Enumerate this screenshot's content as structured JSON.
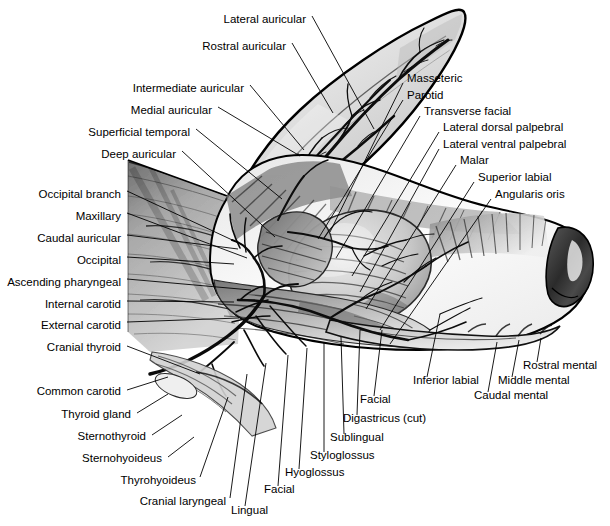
{
  "figure": {
    "background_color": "#ffffff",
    "line_color": "#000000",
    "style": "black-and-white airbrush / stipple medical illustration",
    "width": 610,
    "height": 526
  },
  "labels": [
    {
      "id": "lateral-auricular",
      "text": "Lateral auricular",
      "align": "right",
      "tx": 306,
      "ty": 20,
      "lx": 312,
      "ly": 16,
      "px": 374,
      "py": 129
    },
    {
      "id": "rostral-auricular",
      "text": "Rostral auricular",
      "align": "right",
      "tx": 286,
      "ty": 47,
      "lx": 292,
      "ly": 43,
      "px": 333,
      "py": 113
    },
    {
      "id": "intermediate-auricular",
      "text": "Intermediate auricular",
      "align": "right",
      "tx": 244,
      "ty": 89,
      "lx": 250,
      "ly": 85,
      "px": 304,
      "py": 150
    },
    {
      "id": "medial-auricular",
      "text": "Medial auricular",
      "align": "right",
      "tx": 212,
      "ty": 111,
      "lx": 218,
      "ly": 107,
      "px": 300,
      "py": 156
    },
    {
      "id": "superficial-temporal",
      "text": "Superficial temporal",
      "align": "right",
      "tx": 190,
      "ty": 133,
      "lx": 196,
      "ly": 129,
      "px": 282,
      "py": 199
    },
    {
      "id": "deep-auricular",
      "text": "Deep auricular",
      "align": "right",
      "tx": 176,
      "ty": 155,
      "lx": 182,
      "ly": 151,
      "px": 275,
      "py": 237
    },
    {
      "id": "occipital-branch",
      "text": "Occipital branch",
      "align": "right",
      "tx": 121,
      "ty": 195,
      "lx": 127,
      "ly": 191,
      "px": 243,
      "py": 245
    },
    {
      "id": "maxillary",
      "text": "Maxillary",
      "align": "right",
      "tx": 121,
      "ty": 217,
      "lx": 127,
      "ly": 213,
      "px": 247,
      "py": 258
    },
    {
      "id": "caudal-auricular",
      "text": "Caudal auricular",
      "align": "right",
      "tx": 121,
      "ty": 239,
      "lx": 127,
      "ly": 235,
      "px": 238,
      "py": 249
    },
    {
      "id": "occipital",
      "text": "Occipital",
      "align": "right",
      "tx": 121,
      "ty": 261,
      "lx": 127,
      "ly": 257,
      "px": 234,
      "py": 264
    },
    {
      "id": "ascending-pharyngeal",
      "text": "Ascending pharyngeal",
      "align": "right",
      "tx": 121,
      "ty": 283,
      "lx": 127,
      "ly": 279,
      "px": 251,
      "py": 290
    },
    {
      "id": "internal-carotid",
      "text": "Internal carotid",
      "align": "right",
      "tx": 121,
      "ty": 305,
      "lx": 127,
      "ly": 301,
      "px": 234,
      "py": 302
    },
    {
      "id": "external-carotid",
      "text": "External carotid",
      "align": "right",
      "tx": 121,
      "ty": 326,
      "lx": 127,
      "ly": 322,
      "px": 239,
      "py": 318
    },
    {
      "id": "cranial-thyroid",
      "text": "Cranial thyroid",
      "align": "right",
      "tx": 121,
      "ty": 348,
      "lx": 127,
      "ly": 346,
      "px": 200,
      "py": 374
    },
    {
      "id": "common-carotid",
      "text": "Common carotid",
      "align": "right",
      "tx": 121,
      "ty": 392,
      "lx": 127,
      "ly": 390,
      "px": 168,
      "py": 377
    },
    {
      "id": "thyroid-gland",
      "text": "Thyroid gland",
      "align": "right",
      "tx": 131,
      "ty": 415,
      "lx": 137,
      "ly": 413,
      "px": 168,
      "py": 394
    },
    {
      "id": "sternothyroid",
      "text": "Sternothyroid",
      "align": "right",
      "tx": 146,
      "ty": 437,
      "lx": 152,
      "ly": 435,
      "px": 182,
      "py": 415
    },
    {
      "id": "sternohyoideus",
      "text": "Sternohyoideus",
      "align": "right",
      "tx": 162,
      "ty": 459,
      "lx": 168,
      "ly": 457,
      "px": 194,
      "py": 437
    },
    {
      "id": "thyrohyoideus",
      "text": "Thyrohyoideus",
      "align": "right",
      "tx": 196,
      "ty": 481,
      "lx": 200,
      "ly": 477,
      "px": 228,
      "py": 397
    },
    {
      "id": "cranial-laryngeal",
      "text": "Cranial laryngeal",
      "align": "right",
      "tx": 226,
      "ty": 502,
      "lx": 230,
      "ly": 498,
      "px": 247,
      "py": 374
    },
    {
      "id": "lingual",
      "text": "Lingual",
      "align": "left",
      "tx": 231,
      "ty": 511,
      "lx": 245,
      "ly": 506,
      "px": 266,
      "py": 363
    },
    {
      "id": "facial-ventral",
      "text": "Facial",
      "align": "left",
      "tx": 264,
      "ty": 490,
      "lx": 278,
      "ly": 486,
      "px": 288,
      "py": 355
    },
    {
      "id": "hyoglossus",
      "text": "Hyoglossus",
      "align": "left",
      "tx": 285,
      "ty": 473,
      "lx": 299,
      "ly": 469,
      "px": 307,
      "py": 348
    },
    {
      "id": "styloglossus",
      "text": "Styloglossus",
      "align": "left",
      "tx": 310,
      "ty": 456,
      "lx": 324,
      "ly": 452,
      "px": 324,
      "py": 342
    },
    {
      "id": "sublingual",
      "text": "Sublingual",
      "align": "left",
      "tx": 330,
      "ty": 438,
      "lx": 344,
      "ly": 434,
      "px": 341,
      "py": 337
    },
    {
      "id": "digastricus-cut",
      "text": "Digastricus (cut)",
      "align": "left",
      "tx": 343,
      "ty": 419,
      "lx": 357,
      "ly": 415,
      "px": 360,
      "py": 330
    },
    {
      "id": "facial-lateral",
      "text": "Facial",
      "align": "left",
      "tx": 360,
      "ty": 400,
      "lx": 374,
      "ly": 396,
      "px": 382,
      "py": 330
    },
    {
      "id": "inferior-labial",
      "text": "Inferior labial",
      "align": "left",
      "tx": 413,
      "ty": 381,
      "lx": 427,
      "ly": 377,
      "px": 440,
      "py": 314
    },
    {
      "id": "caudal-mental",
      "text": "Caudal mental",
      "align": "left",
      "tx": 474,
      "ty": 396,
      "lx": 488,
      "ly": 392,
      "px": 497,
      "py": 342
    },
    {
      "id": "middle-mental",
      "text": "Middle mental",
      "align": "left",
      "tx": 498,
      "ty": 381,
      "lx": 512,
      "ly": 377,
      "px": 519,
      "py": 340
    },
    {
      "id": "rostral-mental",
      "text": "Rostral mental",
      "align": "left",
      "tx": 523,
      "ty": 366,
      "lx": 537,
      "ly": 362,
      "px": 541,
      "py": 338
    },
    {
      "id": "masseteric",
      "text": "Masseteric",
      "align": "left",
      "tx": 407,
      "ty": 79,
      "lx": 403,
      "ly": 83,
      "px": 330,
      "py": 232
    },
    {
      "id": "parotid",
      "text": "Parotid",
      "align": "left",
      "tx": 407,
      "ty": 96,
      "lx": 403,
      "ly": 100,
      "px": 318,
      "py": 239
    },
    {
      "id": "transverse-facial",
      "text": "Transverse facial",
      "align": "left",
      "tx": 424,
      "ty": 112,
      "lx": 420,
      "ly": 116,
      "px": 336,
      "py": 258
    },
    {
      "id": "lateral-dorsal-palpebral",
      "text": "Lateral dorsal palpebral",
      "align": "left",
      "tx": 443,
      "ty": 128,
      "lx": 439,
      "ly": 132,
      "px": 352,
      "py": 276
    },
    {
      "id": "lateral-ventral-palpebral",
      "text": "Lateral ventral palpebral",
      "align": "left",
      "tx": 443,
      "ty": 145,
      "lx": 439,
      "ly": 149,
      "px": 360,
      "py": 292
    },
    {
      "id": "malar",
      "text": "Malar",
      "align": "left",
      "tx": 460,
      "ty": 161,
      "lx": 456,
      "ly": 165,
      "px": 366,
      "py": 309
    },
    {
      "id": "superior-labial",
      "text": "Superior labial",
      "align": "left",
      "tx": 478,
      "ty": 178,
      "lx": 474,
      "ly": 182,
      "px": 380,
      "py": 330
    },
    {
      "id": "angularis-oris",
      "text": "Angularis oris",
      "align": "left",
      "tx": 495,
      "ty": 195,
      "lx": 491,
      "ly": 199,
      "px": 390,
      "py": 344
    }
  ]
}
